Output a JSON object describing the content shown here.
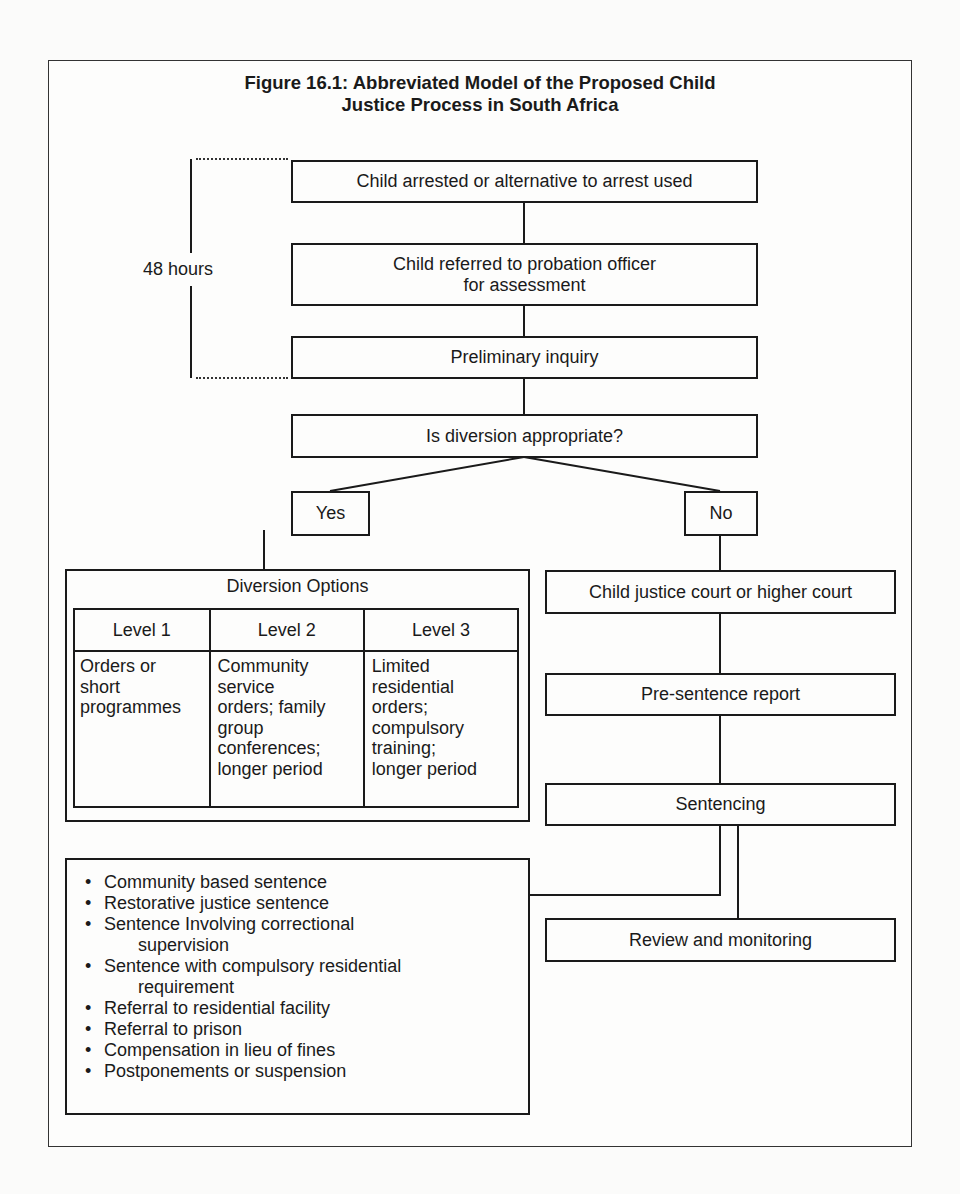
{
  "figure": {
    "title_line1": "Figure 16.1: Abbreviated Model of the Proposed Child",
    "title_line2": "Justice Process in South Africa"
  },
  "timeframe": {
    "label": "48 hours"
  },
  "flow": {
    "arrest": "Child arrested or alternative to arrest used",
    "referral_line1": "Child referred to probation officer",
    "referral_line2": "for assessment",
    "preliminary": "Preliminary inquiry",
    "decision": "Is diversion appropriate?",
    "yes": "Yes",
    "no": "No",
    "court": "Child justice court or higher court",
    "presentence": "Pre-sentence report",
    "sentencing": "Sentencing",
    "review": "Review and monitoring"
  },
  "diversion_options": {
    "title": "Diversion Options",
    "levels": [
      {
        "label": "Level 1",
        "lines": [
          "Orders or",
          "short",
          "programmes"
        ]
      },
      {
        "label": "Level 2",
        "lines": [
          "Community",
          "service",
          "orders; family",
          "group",
          "conferences;",
          "longer period"
        ]
      },
      {
        "label": "Level 3",
        "lines": [
          "Limited",
          "residential",
          "orders;",
          "compulsory",
          "training;",
          "longer period"
        ]
      }
    ]
  },
  "sentences": {
    "bullet": "•",
    "items": [
      {
        "text": "Community based sentence"
      },
      {
        "text": "Restorative justice sentence"
      },
      {
        "text": "Sentence Involving correctional",
        "cont": "supervision"
      },
      {
        "text": "Sentence with compulsory residential",
        "cont": "requirement"
      },
      {
        "text": "Referral to residential facility"
      },
      {
        "text": "Referral to prison"
      },
      {
        "text": "Compensation in lieu of fines"
      },
      {
        "text": "Postponements or suspension"
      }
    ]
  }
}
